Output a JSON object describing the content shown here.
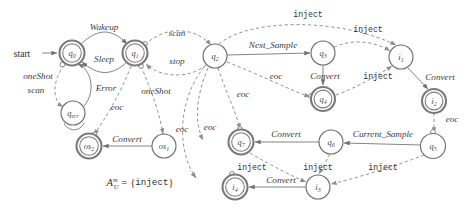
{
  "figure": {
    "start_label": "start",
    "formula": {
      "lhs_base": "A",
      "lhs_sub": "U",
      "lhs_sup": "m",
      "equals": "=",
      "open": "{",
      "set_member": "inject",
      "close": "}"
    },
    "colors": {
      "node_stroke": "#6f6f6f",
      "accept_stroke": "#7a7a7a",
      "edge_solid": "#7d7d7d",
      "edge_dashed": "#8d8d8d",
      "text": "#2f2f2f",
      "background": "#ffffff"
    }
  },
  "nodes": [
    {
      "id": "q0",
      "base": "q",
      "sub": "0",
      "x": 72,
      "y": 53,
      "r": 12.5,
      "accepting": true
    },
    {
      "id": "q1",
      "base": "q",
      "sub": "1",
      "x": 135,
      "y": 53,
      "r": 12.5,
      "accepting": true
    },
    {
      "id": "q2",
      "base": "q",
      "sub": "2",
      "x": 215,
      "y": 56,
      "r": 12.0,
      "accepting": false
    },
    {
      "id": "q3",
      "base": "q",
      "sub": "3",
      "x": 323,
      "y": 53,
      "r": 12.0,
      "accepting": false
    },
    {
      "id": "q4",
      "base": "q",
      "sub": "4",
      "x": 323,
      "y": 99,
      "r": 12.0,
      "accepting": true
    },
    {
      "id": "q5",
      "base": "q",
      "sub": "5",
      "x": 433,
      "y": 146,
      "r": 12.5,
      "accepting": false
    },
    {
      "id": "q6",
      "base": "q",
      "sub": "6",
      "x": 331,
      "y": 142,
      "r": 12.0,
      "accepting": false
    },
    {
      "id": "q7",
      "base": "q",
      "sub": "7",
      "x": 241,
      "y": 142,
      "r": 12.5,
      "accepting": true
    },
    {
      "id": "i1",
      "base": "i",
      "sub": "1",
      "x": 401,
      "y": 57,
      "r": 12.0,
      "accepting": false
    },
    {
      "id": "i2",
      "base": "i",
      "sub": "2",
      "x": 434,
      "y": 101,
      "r": 12.0,
      "accepting": true
    },
    {
      "id": "i3",
      "base": "i",
      "sub": "3",
      "x": 318,
      "y": 187,
      "r": 12.0,
      "accepting": false
    },
    {
      "id": "i4",
      "base": "i",
      "sub": "4",
      "x": 235,
      "y": 187,
      "r": 12.5,
      "accepting": true
    },
    {
      "id": "qerr",
      "base": "q",
      "sub": "err",
      "x": 73,
      "y": 113,
      "r": 12.0,
      "accepting": false
    },
    {
      "id": "os2",
      "base": "os",
      "sub": "2",
      "x": 89,
      "y": 146,
      "r": 12.5,
      "accepting": true
    },
    {
      "id": "os1",
      "base": "os",
      "sub": "1",
      "x": 164,
      "y": 146,
      "r": 12.0,
      "accepting": false
    }
  ],
  "edges": [
    {
      "id": "e-start",
      "label": "",
      "style": "solid",
      "from": "start-arrow",
      "to": "q0"
    },
    {
      "id": "e-q0-q1-wakeup",
      "label": "Wakeup",
      "style": "solid",
      "from": "q0",
      "to": "q1",
      "label_x": 104,
      "label_y": 27
    },
    {
      "id": "e-q1-q0-sleep",
      "label": "Sleep",
      "style": "solid",
      "from": "q1",
      "to": "q0",
      "label_x": 104,
      "label_y": 59
    },
    {
      "id": "e-q1-q2-scan",
      "label": "scan",
      "style": "dashed",
      "from": "q1",
      "to": "q2",
      "label_x": 177,
      "label_y": 33
    },
    {
      "id": "e-q2-q1-stop",
      "label": "stop",
      "style": "dashed",
      "from": "q2",
      "to": "q1",
      "label_x": 177,
      "label_y": 61
    },
    {
      "id": "e-q0-qerr",
      "label": "oneShot",
      "style": "dashed",
      "from": "q0",
      "to": "qerr",
      "label_x": 38,
      "label_y": 76
    },
    {
      "id": "e-q0-qerr-scan",
      "label": "scan",
      "style": "dashed",
      "from": "q0",
      "to": "qerr",
      "label_x": 36,
      "label_y": 90
    },
    {
      "id": "e-qerr-q0-err",
      "label": "Error",
      "style": "solid",
      "from": "qerr",
      "to": "q0",
      "label_x": 106,
      "label_y": 88
    },
    {
      "id": "e-q1-oneshot",
      "label": "oneShot",
      "style": "dashed",
      "from": "q1",
      "to": "os1",
      "label_x": 156,
      "label_y": 91
    },
    {
      "id": "e-q1-eoc",
      "label": "eoc",
      "style": "dashed",
      "from": "q1",
      "to": "os2",
      "label_x": 117,
      "label_y": 107
    },
    {
      "id": "e-os1-os2",
      "label": "Convert",
      "style": "solid",
      "from": "os1",
      "to": "os2",
      "label_x": 127,
      "label_y": 139
    },
    {
      "id": "e-q2-next",
      "label": "Next_Sample",
      "style": "solid",
      "from": "q2",
      "to": "q3",
      "label_x": 273,
      "label_y": 45
    },
    {
      "id": "e-q2-eoc-a",
      "label": "eoc",
      "style": "dashed",
      "from": "q2",
      "to": "q4",
      "label_x": 276,
      "label_y": 76
    },
    {
      "id": "e-q2-eoc-b",
      "label": "eoc",
      "style": "dashed",
      "from": "q2",
      "to": "q7",
      "label_x": 210,
      "label_y": 127
    },
    {
      "id": "e-q2-eoc-c",
      "label": "eoc",
      "style": "dashed",
      "from": "q2",
      "to": "i4",
      "label_x": 182,
      "label_y": 129
    },
    {
      "id": "e-q2-eoc-d",
      "label": "eoc",
      "style": "dashed",
      "from": "q2",
      "to": "q7",
      "label_x": 243,
      "label_y": 94
    },
    {
      "id": "e-q3-q4",
      "label": "Convert",
      "style": "solid",
      "from": "q3",
      "to": "q4",
      "label_x": 325,
      "label_y": 76
    },
    {
      "id": "e-q2-i1-inj",
      "label": "inject",
      "style": "dashed",
      "from": "q2",
      "to": "i1",
      "label_x": 308,
      "label_y": 14
    },
    {
      "id": "e-q3-i1-inj",
      "label": "inject",
      "style": "dashed",
      "from": "q3",
      "to": "i1",
      "label_x": 368,
      "label_y": 29
    },
    {
      "id": "e-q4-i1-inj",
      "label": "inject",
      "style": "dashed",
      "from": "q4",
      "to": "i1",
      "label_x": 378,
      "label_y": 76
    },
    {
      "id": "e-i1-i2",
      "label": "Convert",
      "style": "solid",
      "from": "i1",
      "to": "i2",
      "label_x": 440,
      "label_y": 77
    },
    {
      "id": "e-i2-eoc",
      "label": "eoc",
      "style": "dashed",
      "from": "i2",
      "to": "q5",
      "label_x": 452,
      "label_y": 119
    },
    {
      "id": "e-q5-q6",
      "label": "Current_Sample",
      "style": "solid",
      "from": "q5",
      "to": "q6",
      "label_x": 383,
      "label_y": 134
    },
    {
      "id": "e-q6-q7",
      "label": "Convert",
      "style": "solid",
      "from": "q6",
      "to": "q7",
      "label_x": 286,
      "label_y": 134
    },
    {
      "id": "e-q7-i3-inj",
      "label": "inject",
      "style": "dashed",
      "from": "q7",
      "to": "i3",
      "label_x": 252,
      "label_y": 167
    },
    {
      "id": "e-q6-i3-inj",
      "label": "inject",
      "style": "dashed",
      "from": "q6",
      "to": "i3",
      "label_x": 318,
      "label_y": 167
    },
    {
      "id": "e-q5-i3-inj",
      "label": "inject",
      "style": "dashed",
      "from": "q5",
      "to": "i3",
      "label_x": 383,
      "label_y": 167
    },
    {
      "id": "e-i3-i4",
      "label": "Convert",
      "style": "solid",
      "from": "i3",
      "to": "i4",
      "label_x": 281,
      "label_y": 180
    }
  ]
}
